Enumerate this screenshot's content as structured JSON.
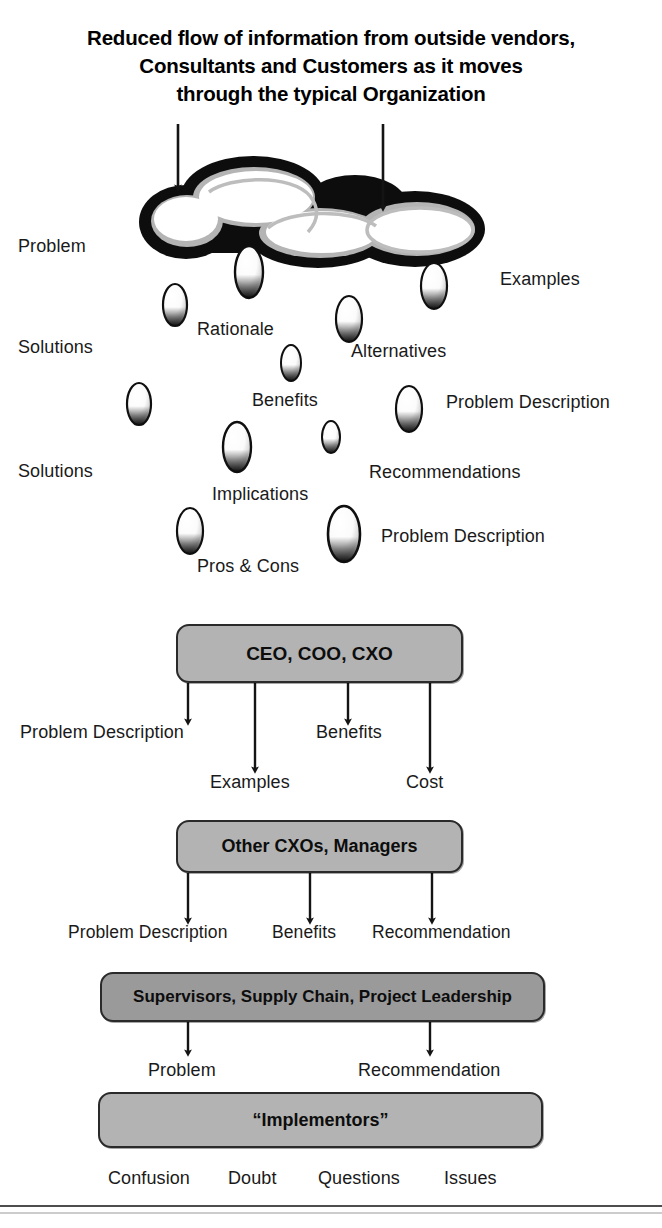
{
  "title": {
    "line1": "Reduced flow of information from outside vendors,",
    "line2": "Consultants and Customers as it moves",
    "line3": "through the typical Organization"
  },
  "colors": {
    "box_fill_light": "#b3b3b3",
    "box_fill_dark": "#9a9a9a",
    "box_border": "#2a2a2a",
    "ink": "#1a1a1a",
    "cloud_outline": "#101010",
    "cloud_inner_gray": "#b0b0b0",
    "droplet_dark": "#111111",
    "rule": "#4d4d4d"
  },
  "cloud": {
    "name": "information-cloud",
    "inflow_arrows": 2
  },
  "droplet_labels": [
    {
      "text": "Problem",
      "x": 18,
      "y": 236
    },
    {
      "text": "Examples",
      "x": 500,
      "y": 269
    },
    {
      "text": "Rationale",
      "x": 197,
      "y": 319
    },
    {
      "text": "Solutions",
      "x": 18,
      "y": 337
    },
    {
      "text": "Alternatives",
      "x": 351,
      "y": 341
    },
    {
      "text": "Benefits",
      "x": 252,
      "y": 390
    },
    {
      "text": "Problem Description",
      "x": 446,
      "y": 392
    },
    {
      "text": "Solutions",
      "x": 18,
      "y": 461
    },
    {
      "text": "Recommendations",
      "x": 369,
      "y": 462
    },
    {
      "text": "Implications",
      "x": 212,
      "y": 484
    },
    {
      "text": "Problem Description",
      "x": 381,
      "y": 526
    },
    {
      "text": "Pros & Cons",
      "x": 197,
      "y": 556
    }
  ],
  "droplets": [
    {
      "cx": 175,
      "cy": 305,
      "rx": 12,
      "ry": 21
    },
    {
      "cx": 249,
      "cy": 272,
      "rx": 14,
      "ry": 26
    },
    {
      "cx": 349,
      "cy": 319,
      "rx": 13,
      "ry": 23
    },
    {
      "cx": 434,
      "cy": 286,
      "rx": 13,
      "ry": 23
    },
    {
      "cx": 291,
      "cy": 363,
      "rx": 10,
      "ry": 18
    },
    {
      "cx": 139,
      "cy": 404,
      "rx": 12,
      "ry": 21
    },
    {
      "cx": 409,
      "cy": 409,
      "rx": 13,
      "ry": 23
    },
    {
      "cx": 237,
      "cy": 447,
      "rx": 14,
      "ry": 25
    },
    {
      "cx": 331,
      "cy": 437,
      "rx": 9,
      "ry": 16
    },
    {
      "cx": 190,
      "cy": 531,
      "rx": 13,
      "ry": 23
    },
    {
      "cx": 344,
      "cy": 534,
      "rx": 16,
      "ry": 28
    }
  ],
  "org_boxes": [
    {
      "id": "ceo",
      "label": "CEO, COO, CXO",
      "x": 176,
      "y": 624,
      "w": 287,
      "h": 59,
      "fill": "#b3b3b3",
      "font_size": 19
    },
    {
      "id": "other-cxos",
      "label": "Other CXOs, Managers",
      "x": 176,
      "y": 820,
      "w": 287,
      "h": 53,
      "fill": "#b3b3b3",
      "font_size": 18
    },
    {
      "id": "supervisors",
      "label": "Supervisors, Supply Chain, Project Leadership",
      "x": 100,
      "y": 972,
      "w": 445,
      "h": 50,
      "fill": "#9a9a9a",
      "font_size": 17
    },
    {
      "id": "implementors",
      "label": "“Implementors”",
      "x": 98,
      "y": 1092,
      "w": 445,
      "h": 56,
      "fill": "#b3b3b3",
      "font_size": 18
    }
  ],
  "flow_labels": {
    "tier1": [
      {
        "text": "Problem Description",
        "x": 20,
        "y": 722
      },
      {
        "text": "Examples",
        "x": 210,
        "y": 772
      },
      {
        "text": "Benefits",
        "x": 316,
        "y": 722
      },
      {
        "text": "Cost",
        "x": 406,
        "y": 772
      }
    ],
    "tier2": [
      {
        "text": "Problem Description",
        "x": 68,
        "y": 922
      },
      {
        "text": "Benefits",
        "x": 272,
        "y": 922
      },
      {
        "text": "Recommendation",
        "x": 372,
        "y": 922
      }
    ],
    "tier3": [
      {
        "text": "Problem",
        "x": 148,
        "y": 1060
      },
      {
        "text": "Recommendation",
        "x": 358,
        "y": 1060
      }
    ],
    "tier4": [
      {
        "text": "Confusion",
        "x": 108,
        "y": 1168
      },
      {
        "text": "Doubt",
        "x": 228,
        "y": 1168
      },
      {
        "text": "Questions",
        "x": 318,
        "y": 1168
      },
      {
        "text": "Issues",
        "x": 444,
        "y": 1168
      }
    ]
  },
  "arrows": {
    "cloud_inflow": [
      {
        "x": 178,
        "y1": 124,
        "y2": 192
      },
      {
        "x": 383,
        "y1": 124,
        "y2": 212
      }
    ],
    "from_ceo": [
      {
        "x": 188,
        "y1": 683,
        "y2": 726
      },
      {
        "x": 255,
        "y1": 683,
        "y2": 774
      },
      {
        "x": 348,
        "y1": 683,
        "y2": 726
      },
      {
        "x": 430,
        "y1": 683,
        "y2": 774
      }
    ],
    "from_other_cxos": [
      {
        "x": 188,
        "y1": 873,
        "y2": 925
      },
      {
        "x": 310,
        "y1": 873,
        "y2": 925
      },
      {
        "x": 432,
        "y1": 873,
        "y2": 925
      }
    ],
    "from_supervisors": [
      {
        "x": 188,
        "y1": 1022,
        "y2": 1056
      },
      {
        "x": 430,
        "y1": 1022,
        "y2": 1056
      }
    ]
  },
  "footer_rule": {
    "y": 1208
  }
}
